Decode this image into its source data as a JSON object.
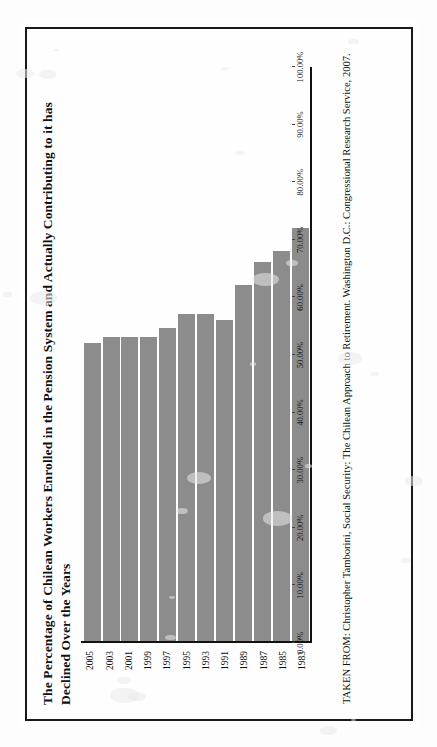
{
  "page": {
    "title": "The Percentage of Chilean Workers Enrolled in the Pension System and Actually Contributing to it has Declined Over the Years",
    "source": "TAKEN FROM: Christopher Tamborini, Social Security: The Chilean Approach to Retirement. Washington D.C.: Congressional Research Service, 2007."
  },
  "colors": {
    "bar": "#8c8c8c",
    "axis": "#111111",
    "border": "#1a1a1a",
    "paper": "#fefefe"
  },
  "chart_data": {
    "type": "bar",
    "orientation": "horizontal",
    "title": "The Percentage of Chilean Workers Enrolled in the Pension System and Actually Contributing to it has Declined Over the Years",
    "xlabel": "",
    "ylabel": "",
    "categories": [
      "1983",
      "1985",
      "1987",
      "1989",
      "1991",
      "1993",
      "1995",
      "1997",
      "1999",
      "2001",
      "2003",
      "2005"
    ],
    "values": [
      72.0,
      68.0,
      66.0,
      62.0,
      56.0,
      57.0,
      57.0,
      54.5,
      53.0,
      53.0,
      53.0,
      52.0
    ],
    "value_labels": [
      "72.00%",
      "68.00%",
      "66.00%",
      "62.00%",
      "56.00%",
      "57.00%",
      "57.00%",
      "54.50%",
      "53.00%",
      "53.00%",
      "53.00%",
      "52.00%"
    ],
    "xlim": [
      0,
      100
    ],
    "tick_labels": [
      "0.00%",
      "10.00%",
      "20.00%",
      "30.00%",
      "40.00%",
      "50.00%",
      "60.00%",
      "70.00%",
      "80.00%",
      "90.00%",
      "100.00%"
    ],
    "tick_values": [
      0,
      10,
      20,
      30,
      40,
      50,
      60,
      70,
      80,
      90,
      100
    ],
    "grid": false,
    "legend": "none",
    "series": [
      {
        "name": "Percent enrolled and actually contributing",
        "values": [
          72.0,
          68.0,
          66.0,
          62.0,
          56.0,
          57.0,
          57.0,
          54.5,
          53.0,
          53.0,
          53.0,
          52.0
        ]
      }
    ]
  }
}
